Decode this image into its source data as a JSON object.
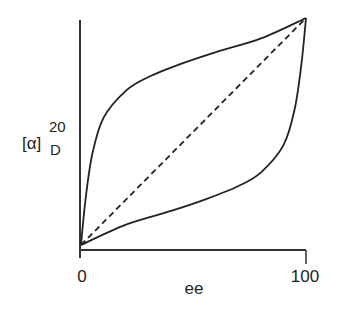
{
  "chart_data": {
    "type": "line",
    "title": "",
    "xlabel": "ee",
    "ylabel": "[α]",
    "ylabel_superscript": "20",
    "ylabel_subscript": "D",
    "xlim": [
      0,
      100
    ],
    "ylim": [
      0,
      100
    ],
    "x_ticks": [
      "0",
      "100"
    ],
    "grid": false,
    "legend": "none",
    "series": [
      {
        "name": "upper-curve",
        "style": "solid",
        "x": [
          0,
          2,
          5,
          10,
          20,
          30,
          45,
          60,
          80,
          100
        ],
        "y": [
          0,
          20,
          40,
          56,
          68,
          74,
          80,
          85,
          91,
          100
        ]
      },
      {
        "name": "diagonal",
        "style": "dashed",
        "x": [
          0,
          100
        ],
        "y": [
          0,
          100
        ]
      },
      {
        "name": "lower-curve",
        "style": "solid",
        "x": [
          0,
          20,
          40,
          55,
          70,
          80,
          90,
          95,
          98,
          100
        ],
        "y": [
          0,
          9,
          15,
          20,
          26,
          32,
          44,
          60,
          80,
          100
        ]
      }
    ]
  }
}
